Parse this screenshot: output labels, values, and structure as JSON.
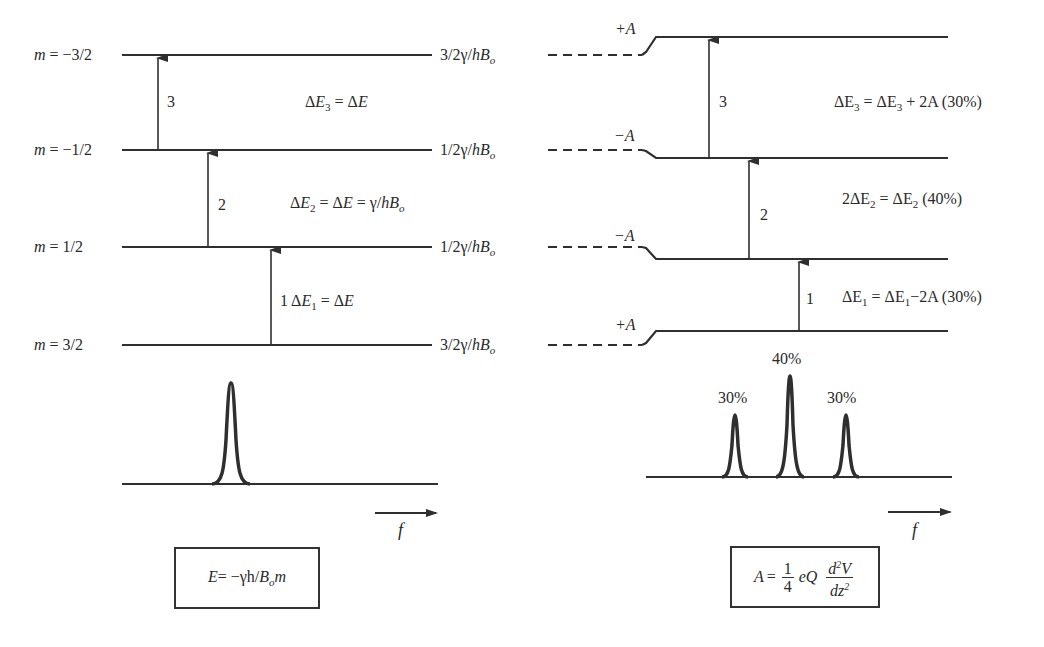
{
  "left_panel": {
    "levels": [
      {
        "m_label_prefix": "m",
        "m_value": " = −3/2",
        "energy": "3/2γ/",
        "energy_h": "h",
        "energy_B": "B",
        "energy_sub": "o",
        "y": 55
      },
      {
        "m_label_prefix": "m",
        "m_value": " = −1/2",
        "energy": "1/2γ/",
        "energy_h": "h",
        "energy_B": "B",
        "energy_sub": "o",
        "y": 150
      },
      {
        "m_label_prefix": "m",
        "m_value": " = 1/2",
        "energy": "1/2γ/",
        "energy_h": "h",
        "energy_B": "B",
        "energy_sub": "o",
        "y": 247
      },
      {
        "m_label_prefix": "m",
        "m_value": " = 3/2",
        "energy": "3/2γ/",
        "energy_h": "h",
        "energy_B": "B",
        "energy_sub": "o",
        "y": 345
      }
    ],
    "transitions": [
      {
        "number": "3",
        "equation": {
          "delta": "Δ",
          "E": "E",
          "sub": "3",
          "rest": " = Δ",
          "rest_E": "E"
        }
      },
      {
        "number": "2",
        "equation": {
          "delta": "Δ",
          "E": "E",
          "sub": "2",
          "rest": " = Δ",
          "rest_E": "E",
          "tail": " = γ/",
          "tail_h": "h",
          "tail_B": "B",
          "tail_sub": "o"
        }
      },
      {
        "number": "1",
        "equation": {
          "delta": " Δ",
          "E": "E",
          "sub": "1",
          "rest": " = Δ",
          "rest_E": "E"
        }
      }
    ],
    "spectrum": {
      "peaks": 1
    },
    "axis_label": "f",
    "formula_box": {
      "E": "E",
      "eq": "= −γh/",
      "B": "B",
      "sub": "o",
      "m": "m"
    }
  },
  "right_panel": {
    "shift_labels": [
      "+A",
      "−A",
      "−A",
      "+A"
    ],
    "transitions": [
      {
        "number": "3",
        "equation": {
          "lhs": "ΔE",
          "lhs_sub": "3",
          "mid": " = ΔE",
          "mid_sub": "3",
          "tail": " + 2A",
          "pct": " (30%)"
        }
      },
      {
        "number": "2",
        "equation": {
          "lhs": "2ΔE",
          "lhs_sub": "2",
          "mid": " = ΔE",
          "mid_sub": "2",
          "tail": "",
          "pct": " (40%)"
        }
      },
      {
        "number": "1",
        "equation": {
          "lhs": "ΔE",
          "lhs_sub": "1",
          "mid": " = ΔE",
          "mid_sub": "1",
          "tail": "−2A",
          "pct": " (30%)"
        }
      }
    ],
    "spectrum_peaks": [
      {
        "label": "30%",
        "relative_intensity": 30
      },
      {
        "label": "40%",
        "relative_intensity": 40
      },
      {
        "label": "30%",
        "relative_intensity": 30
      }
    ],
    "axis_label": "f",
    "formula_box": {
      "A": "A",
      "eq": "=",
      "num": "1",
      "den": "4",
      "eQ": "eQ",
      "d2V": "d",
      "d2V_sup": "2",
      "V": "V",
      "dz": "dz",
      "dz_sup": "2"
    }
  },
  "colors": {
    "line": "#2f2f2f",
    "background": "#ffffff"
  }
}
